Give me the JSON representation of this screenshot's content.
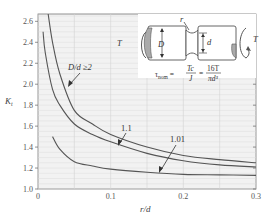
{
  "chart_data": {
    "type": "line",
    "title": "",
    "xlabel": "r/d",
    "ylabel": "K_t",
    "xlim": [
      0,
      0.3
    ],
    "ylim": [
      1.0,
      2.67
    ],
    "xticks": [
      0,
      0.1,
      0.2,
      0.3
    ],
    "xtick_labels": [
      "0",
      "0.1",
      "0.2",
      "0.3"
    ],
    "yticks": [
      1.0,
      1.2,
      1.4,
      1.6,
      1.8,
      2.0,
      2.2,
      2.4,
      2.6
    ],
    "ytick_labels": [
      "1.0",
      "1.2",
      "1.4",
      "1.6",
      "1.8",
      "2.0",
      "2.2",
      "2.4",
      "2.6"
    ],
    "grid": true,
    "legend_position": "inline annotations with arrows",
    "series": [
      {
        "name": "D/d ≥2",
        "label": "D/d ≥2",
        "x": [
          0.014,
          0.02,
          0.03,
          0.05,
          0.075,
          0.1,
          0.15,
          0.2,
          0.25,
          0.3
        ],
        "y": [
          2.67,
          2.4,
          2.1,
          1.75,
          1.62,
          1.52,
          1.4,
          1.32,
          1.28,
          1.25
        ]
      },
      {
        "name": "1.1",
        "label": "1.1",
        "x": [
          0.007,
          0.01,
          0.02,
          0.03,
          0.05,
          0.075,
          0.1,
          0.15,
          0.2,
          0.25,
          0.3
        ],
        "y": [
          2.5,
          2.3,
          1.95,
          1.8,
          1.62,
          1.52,
          1.45,
          1.34,
          1.27,
          1.23,
          1.21
        ]
      },
      {
        "name": "1.01",
        "label": "1.01",
        "x": [
          0.02,
          0.03,
          0.05,
          0.075,
          0.1,
          0.15,
          0.2,
          0.25,
          0.3
        ],
        "y": [
          1.5,
          1.38,
          1.26,
          1.22,
          1.19,
          1.16,
          1.14,
          1.135,
          1.13
        ]
      }
    ],
    "annotations": [
      {
        "text": "D/d ≥2",
        "target_series": "D/d ≥2"
      },
      {
        "text": "1.1",
        "target_series": "1.1"
      },
      {
        "text": "1.01",
        "target_series": "1.01"
      }
    ],
    "inset": {
      "description": "Grooved shaft in torsion",
      "labels": {
        "torque_left": "T",
        "torque_right": "T",
        "outer_diameter": "D",
        "inner_diameter": "d",
        "radius": "r"
      },
      "formula": {
        "lhs": "τnom",
        "eq1_num": "Tc",
        "eq1_den": "J",
        "eq2_num": "16T",
        "eq2_den": "πd³"
      }
    }
  },
  "colors": {
    "curve": "#555555",
    "grid": "#d8d8d8",
    "plot_bg": "#f2f2f2",
    "axis": "#777777"
  }
}
